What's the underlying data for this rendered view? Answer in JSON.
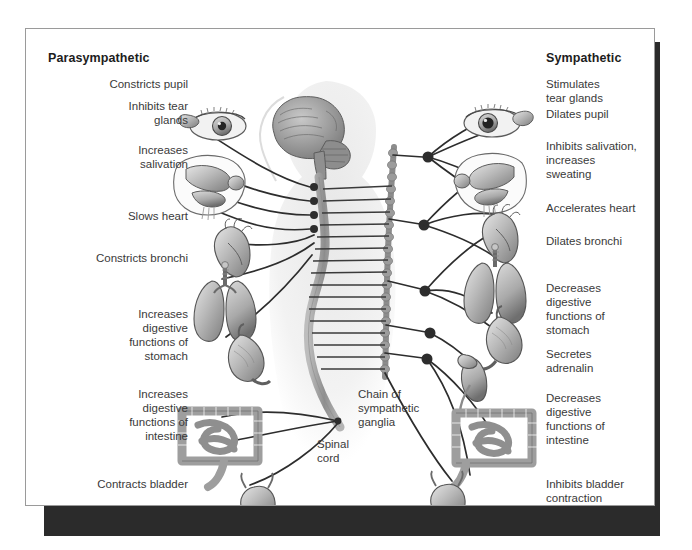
{
  "figure": {
    "headings": {
      "left": "Parasympathetic",
      "right": "Sympathetic"
    },
    "left_labels": [
      "Constricts pupil",
      "Inhibits tear\nglands",
      "Increases\nsalivation",
      "Slows heart",
      "Constricts bronchi",
      "Increases\ndigestive\nfunctions of\nstomach",
      "Increases\ndigestive\nfunctions of\nintestine",
      "Contracts bladder"
    ],
    "right_labels": [
      "Stimulates\ntear glands",
      "Dilates pupil",
      "Inhibits salivation,\nincreases\nsweating",
      "Accelerates heart",
      "Dilates bronchi",
      "Decreases\ndigestive\nfunctions of\nstomach",
      "Secretes\nadrenalin",
      "Decreases\ndigestive\nfunctions of\nintestine",
      "Inhibits bladder\ncontraction"
    ],
    "center_labels": [
      "Chain of\nsympathetic\nganglia",
      "Spinal\ncord"
    ],
    "organs": {
      "left": [
        "eye",
        "tear-gland",
        "salivary-gland-head",
        "heart",
        "lungs",
        "stomach",
        "intestine",
        "bladder"
      ],
      "right": [
        "eye",
        "tear-gland",
        "salivary-gland-head",
        "heart",
        "lungs",
        "stomach",
        "kidney-adrenal",
        "intestine",
        "bladder"
      ],
      "center": [
        "brain",
        "spinal-cord",
        "sympathetic-ganglia-chain",
        "body-silhouette"
      ]
    },
    "colors": {
      "paper": "#ffffff",
      "shadow": "#2b2b2b",
      "border": "#9a9a9a",
      "nerve": "#2e2e2e",
      "cord": "#9a9a9a",
      "organ_light": "#d8d8d8",
      "organ_mid": "#a8a8a8",
      "organ_dark": "#6e6e6e",
      "silhouette": "#eeeeee",
      "text": "#3a3a3a",
      "heading_text": "#1d1d1d"
    }
  }
}
